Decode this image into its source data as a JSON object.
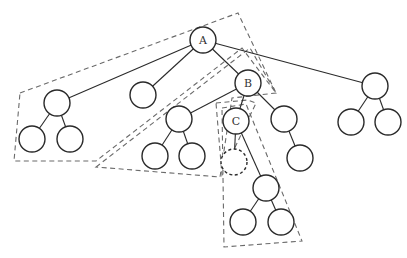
{
  "diagram": {
    "type": "tree",
    "colors": {
      "node_stroke": "#2a2a2a",
      "edge": "#2a2a2a",
      "region_stroke": "#6a6a6a",
      "background": "#ffffff"
    },
    "nodes": [
      {
        "id": "A",
        "label": "A",
        "x": 203,
        "y": 40,
        "r": 13,
        "style": "solid"
      },
      {
        "id": "L",
        "label": "",
        "x": 57,
        "y": 103,
        "r": 13,
        "style": "solid"
      },
      {
        "id": "LL",
        "label": "",
        "x": 32,
        "y": 139,
        "r": 13,
        "style": "solid"
      },
      {
        "id": "LR",
        "label": "",
        "x": 70,
        "y": 139,
        "r": 13,
        "style": "solid"
      },
      {
        "id": "M",
        "label": "",
        "x": 143,
        "y": 95,
        "r": 13,
        "style": "solid"
      },
      {
        "id": "B",
        "label": "B",
        "x": 248,
        "y": 83,
        "r": 13,
        "style": "solid"
      },
      {
        "id": "R",
        "label": "",
        "x": 375,
        "y": 86,
        "r": 13,
        "style": "solid"
      },
      {
        "id": "RL",
        "label": "",
        "x": 351,
        "y": 122,
        "r": 13,
        "style": "solid"
      },
      {
        "id": "RR",
        "label": "",
        "x": 388,
        "y": 122,
        "r": 13,
        "style": "solid"
      },
      {
        "id": "BL",
        "label": "",
        "x": 179,
        "y": 119,
        "r": 13,
        "style": "solid"
      },
      {
        "id": "BLL",
        "label": "",
        "x": 155,
        "y": 156,
        "r": 13,
        "style": "solid"
      },
      {
        "id": "BLR",
        "label": "",
        "x": 192,
        "y": 156,
        "r": 13,
        "style": "solid"
      },
      {
        "id": "C",
        "label": "C",
        "x": 236,
        "y": 121,
        "r": 13,
        "style": "solid"
      },
      {
        "id": "BR",
        "label": "",
        "x": 284,
        "y": 119,
        "r": 13,
        "style": "solid"
      },
      {
        "id": "BRC",
        "label": "",
        "x": 300,
        "y": 158,
        "r": 13,
        "style": "solid"
      },
      {
        "id": "CL",
        "label": "",
        "x": 234,
        "y": 162,
        "r": 13,
        "style": "dashed"
      },
      {
        "id": "CR",
        "label": "",
        "x": 266,
        "y": 188,
        "r": 13,
        "style": "solid"
      },
      {
        "id": "CRL",
        "label": "",
        "x": 243,
        "y": 222,
        "r": 13,
        "style": "solid"
      },
      {
        "id": "CRR",
        "label": "",
        "x": 281,
        "y": 222,
        "r": 13,
        "style": "solid"
      }
    ],
    "edges": [
      [
        "A",
        "L"
      ],
      [
        "A",
        "M"
      ],
      [
        "A",
        "B"
      ],
      [
        "A",
        "R"
      ],
      [
        "L",
        "LL"
      ],
      [
        "L",
        "LR"
      ],
      [
        "R",
        "RL"
      ],
      [
        "R",
        "RR"
      ],
      [
        "B",
        "BL"
      ],
      [
        "B",
        "C"
      ],
      [
        "B",
        "BR"
      ],
      [
        "BL",
        "BLL"
      ],
      [
        "BL",
        "BLR"
      ],
      [
        "BR",
        "BRC"
      ],
      [
        "C",
        "CL"
      ],
      [
        "C",
        "CR"
      ],
      [
        "CR",
        "CRL"
      ],
      [
        "CR",
        "CRR"
      ]
    ],
    "regions": [
      {
        "id": "outer-region",
        "points": [
          [
            20,
            93
          ],
          [
            238,
            13
          ],
          [
            276,
            93
          ],
          [
            242,
            48
          ],
          [
            96,
            161
          ],
          [
            14,
            161
          ]
        ]
      },
      {
        "id": "middle-region",
        "points": [
          [
            96,
            167
          ],
          [
            250,
            48
          ],
          [
            276,
            93
          ],
          [
            232,
            98
          ],
          [
            220,
            177
          ]
        ]
      },
      {
        "id": "c-region-inner",
        "points": [
          [
            216,
            103
          ],
          [
            248,
            100
          ],
          [
            256,
            103
          ],
          [
            222,
            175
          ]
        ]
      },
      {
        "id": "c-region",
        "points": [
          [
            222,
            108
          ],
          [
            246,
            104
          ],
          [
            302,
            241
          ],
          [
            224,
            247
          ]
        ]
      }
    ]
  }
}
